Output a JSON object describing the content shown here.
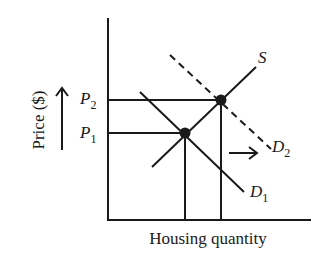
{
  "diagram": {
    "x_axis_label": "Housing quantity",
    "y_axis_label": "Price ($)",
    "price_labels": [
      {
        "name": "P",
        "sub": "2"
      },
      {
        "name": "P",
        "sub": "1"
      }
    ],
    "curves": {
      "supply": {
        "name": "S"
      },
      "demand_initial": {
        "name": "D",
        "sub": "1"
      },
      "demand_shifted": {
        "name": "D",
        "sub": "2",
        "style": "dashed"
      }
    },
    "annotations": {
      "price_increase_arrow": "up",
      "demand_shift_arrow": "right"
    },
    "equilibria": [
      {
        "label": "initial",
        "price": "P1"
      },
      {
        "label": "new",
        "price": "P2"
      }
    ],
    "colors": {
      "ink": "#1a1a1a",
      "background": "#ffffff"
    }
  }
}
